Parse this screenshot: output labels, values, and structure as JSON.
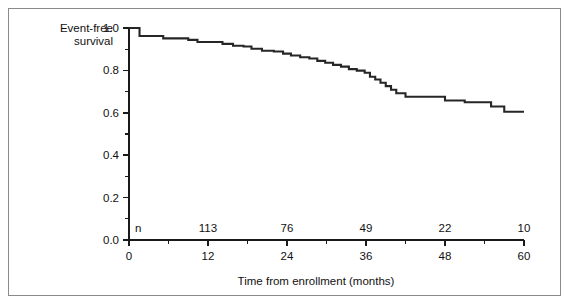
{
  "chart_data": {
    "type": "line",
    "subtype": "kaplan-meier-step",
    "title": "",
    "xlabel": "Time from enrollment (months)",
    "ylabel": "Event-free survival",
    "ylabel_lines": [
      "Event-free",
      "survival"
    ],
    "xlim": [
      0,
      60
    ],
    "ylim": [
      0.0,
      1.0
    ],
    "grid": false,
    "legend": null,
    "x_major_ticks": [
      0,
      12,
      24,
      36,
      48,
      60
    ],
    "x_major_tick_labels": [
      "0",
      "12",
      "24",
      "36",
      "48",
      "60"
    ],
    "x_minor_ticks": [
      6,
      18,
      30,
      42,
      54
    ],
    "y_major_ticks": [
      0.0,
      0.2,
      0.4,
      0.6,
      0.8,
      1.0
    ],
    "y_major_tick_labels": [
      "0.0",
      "0.2",
      "0.4",
      "0.6",
      "0.8",
      "1.0"
    ],
    "y_minor_ticks": [
      0.1,
      0.3,
      0.5,
      0.7,
      0.9
    ],
    "risk_table": {
      "row_label": "n",
      "times": [
        12,
        24,
        36,
        48,
        60
      ],
      "counts": [
        "113",
        "76",
        "49",
        "22",
        "10"
      ]
    },
    "series": [
      {
        "name": "Event-free survival",
        "color": "#262626",
        "step": "post",
        "x": [
          0.0,
          0.8,
          1.6,
          3.0,
          5.2,
          7.6,
          9.0,
          10.4,
          12.6,
          14.2,
          15.8,
          17.4,
          18.6,
          20.2,
          22.0,
          23.4,
          24.6,
          26.0,
          27.4,
          28.6,
          29.8,
          31.0,
          32.2,
          33.4,
          34.6,
          35.8,
          36.6,
          37.4,
          38.2,
          39.0,
          39.8,
          40.6,
          42.0,
          45.0,
          48.0,
          51.0,
          53.5,
          55.0,
          57.0,
          60.0
        ],
        "y": [
          1.0,
          1.0,
          0.962,
          0.962,
          0.951,
          0.951,
          0.944,
          0.934,
          0.934,
          0.925,
          0.916,
          0.913,
          0.902,
          0.893,
          0.889,
          0.879,
          0.87,
          0.862,
          0.856,
          0.845,
          0.836,
          0.826,
          0.818,
          0.806,
          0.799,
          0.789,
          0.77,
          0.757,
          0.742,
          0.726,
          0.709,
          0.692,
          0.676,
          0.676,
          0.658,
          0.65,
          0.65,
          0.63,
          0.605,
          0.605
        ]
      }
    ]
  }
}
